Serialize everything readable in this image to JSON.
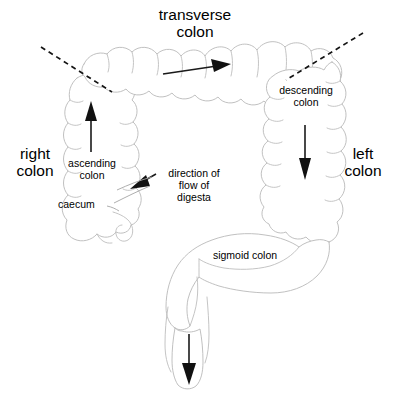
{
  "diagram": {
    "title": "transverse\ncolon",
    "background_color": "#ffffff",
    "outline_color": "#b9b9b9",
    "arrow_color": "#111111",
    "dash_color": "#141414",
    "labels": {
      "transverse_colon": "transverse\ncolon",
      "right_colon": "right\ncolon",
      "left_colon": "left\ncolon",
      "ascending_colon": "ascending\ncolon",
      "descending_colon": "descending\ncolon",
      "caecum": "caecum",
      "direction_of_flow": "direction of\nflow of\ndigesta",
      "sigmoid_colon": "sigmoid colon"
    },
    "flow_arrows": [
      {
        "name": "transverse-flow-arrow",
        "direction": "right"
      },
      {
        "name": "ascending-flow-arrow",
        "direction": "up"
      },
      {
        "name": "descending-flow-arrow",
        "direction": "down"
      },
      {
        "name": "caecum-flow-arrow",
        "direction": "left-down"
      },
      {
        "name": "rectum-flow-arrow",
        "direction": "down"
      }
    ],
    "flexure_markers": [
      {
        "name": "hepatic-flexure-dash"
      },
      {
        "name": "splenic-flexure-dash"
      }
    ]
  }
}
